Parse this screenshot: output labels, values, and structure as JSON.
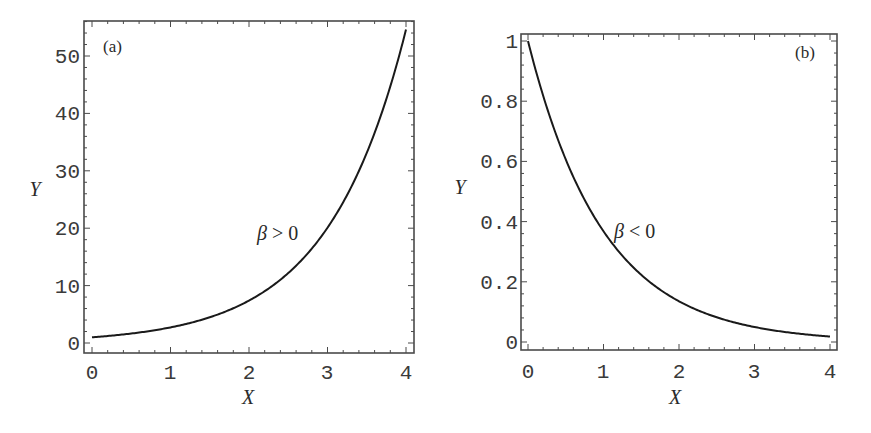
{
  "figure": {
    "panels": [
      {
        "tag": "(a)",
        "xlabel": "X",
        "ylabel": "Y",
        "annotation": {
          "symbol": "β",
          "relation": " > 0"
        },
        "xticks": [
          "0",
          "1",
          "2",
          "3",
          "4"
        ],
        "yticks": [
          "0",
          "10",
          "20",
          "30",
          "40",
          "50"
        ]
      },
      {
        "tag": "(b)",
        "xlabel": "X",
        "ylabel": "Y",
        "annotation": {
          "symbol": "β",
          "relation": " < 0"
        },
        "xticks": [
          "0",
          "1",
          "2",
          "3",
          "4"
        ],
        "yticks": [
          "0",
          "0.2",
          "0.4",
          "0.6",
          "0.8",
          "1"
        ]
      }
    ]
  },
  "chart_data": [
    {
      "type": "line",
      "title": "(a)",
      "xlabel": "X",
      "ylabel": "Y",
      "xlim": [
        0,
        4
      ],
      "ylim": [
        0,
        55
      ],
      "grid": false,
      "annotations": [
        "β > 0"
      ],
      "xticks": [
        0,
        1,
        2,
        3,
        4
      ],
      "yticks": [
        0,
        10,
        20,
        30,
        40,
        50
      ],
      "series": [
        {
          "name": "β > 0 (Y = e^X)",
          "x": [
            0,
            0.5,
            1,
            1.5,
            2,
            2.5,
            3,
            3.5,
            4
          ],
          "y": [
            1.0,
            1.65,
            2.72,
            4.48,
            7.39,
            12.18,
            20.09,
            33.12,
            54.6
          ]
        }
      ]
    },
    {
      "type": "line",
      "title": "(b)",
      "xlabel": "X",
      "ylabel": "Y",
      "xlim": [
        0,
        4
      ],
      "ylim": [
        0,
        1
      ],
      "grid": false,
      "annotations": [
        "β < 0"
      ],
      "xticks": [
        0,
        1,
        2,
        3,
        4
      ],
      "yticks": [
        0,
        0.2,
        0.4,
        0.6,
        0.8,
        1
      ],
      "series": [
        {
          "name": "β < 0 (Y = e^-X)",
          "x": [
            0,
            0.5,
            1,
            1.5,
            2,
            2.5,
            3,
            3.5,
            4
          ],
          "y": [
            1.0,
            0.607,
            0.368,
            0.223,
            0.135,
            0.082,
            0.05,
            0.03,
            0.018
          ]
        }
      ]
    }
  ]
}
